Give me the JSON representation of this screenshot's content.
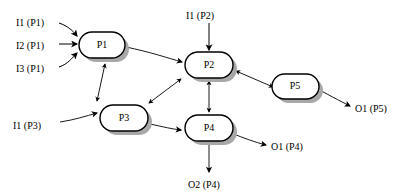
{
  "diagram": {
    "background_color": "#ffffff",
    "stroke_color": "#000000",
    "shadow_color": "#a8a8a8",
    "nodes": [
      {
        "id": "P1",
        "label": "P1",
        "x": 79,
        "y": 32,
        "w": 46,
        "h": 26
      },
      {
        "id": "P2",
        "label": "P2",
        "x": 185,
        "y": 52,
        "w": 48,
        "h": 26
      },
      {
        "id": "P3",
        "label": "P3",
        "x": 100,
        "y": 105,
        "w": 48,
        "h": 26
      },
      {
        "id": "P4",
        "label": "P4",
        "x": 185,
        "y": 115,
        "w": 48,
        "h": 26
      },
      {
        "id": "P5",
        "label": "P5",
        "x": 272,
        "y": 74,
        "w": 47,
        "h": 25
      }
    ],
    "inputs": [
      {
        "id": "i1p1",
        "label": "I1 (P1)",
        "target": "P1"
      },
      {
        "id": "i2p1",
        "label": "I2 (P1)",
        "target": "P1"
      },
      {
        "id": "i3p1",
        "label": "I3 (P1)",
        "target": "P1"
      },
      {
        "id": "i1p2",
        "label": "I1 (P2)",
        "target": "P2"
      },
      {
        "id": "i1p3",
        "label": "I1 (P3)",
        "target": "P3"
      }
    ],
    "outputs": [
      {
        "id": "o1p5",
        "label": "O1 (P5)",
        "source": "P5"
      },
      {
        "id": "o1p4",
        "label": "O1 (P4)",
        "source": "P4"
      },
      {
        "id": "o2p4",
        "label": "O2 (P4)",
        "source": "P4"
      }
    ],
    "edges": [
      {
        "from": "P1",
        "to": "P2",
        "direction": "one-way"
      },
      {
        "from": "P1",
        "to": "P3",
        "direction": "bidirectional"
      },
      {
        "from": "P3",
        "to": "P2",
        "direction": "bidirectional"
      },
      {
        "from": "P3",
        "to": "P4",
        "direction": "one-way"
      },
      {
        "from": "P4",
        "to": "P2",
        "direction": "bidirectional"
      },
      {
        "from": "P5",
        "to": "P2",
        "direction": "bidirectional"
      }
    ],
    "label_positions": {
      "i1p1": {
        "x": 16,
        "y": 21
      },
      "i2p1": {
        "x": 16,
        "y": 45
      },
      "i3p1": {
        "x": 16,
        "y": 69
      },
      "i1p2": {
        "x": 187,
        "y": 16
      },
      "i1p3": {
        "x": 13,
        "y": 125
      },
      "o1p5": {
        "x": 355,
        "y": 108
      },
      "o1p4": {
        "x": 272,
        "y": 148
      },
      "o2p4": {
        "x": 189,
        "y": 185
      }
    }
  }
}
